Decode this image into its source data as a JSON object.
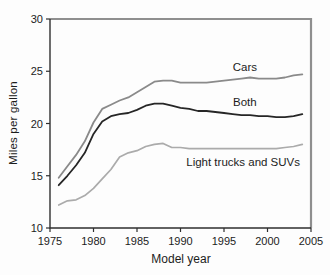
{
  "figure": {
    "background": "#fdfdfd",
    "frame_color_topright": "#8f8f8f",
    "axis_color": "#2f2f2f",
    "text_color": "#1c1c1c"
  },
  "chart_data": {
    "type": "line",
    "title": "",
    "xlabel": "Model year",
    "ylabel": "Miles per gallon",
    "xlim": [
      1975,
      2005
    ],
    "ylim": [
      10,
      30
    ],
    "xticks": [
      1975,
      1980,
      1985,
      1990,
      1995,
      2000,
      2005
    ],
    "yticks": [
      10,
      15,
      20,
      25,
      30
    ],
    "grid": false,
    "legend_position": "inline-annotations",
    "x": [
      1976,
      1977,
      1978,
      1979,
      1980,
      1981,
      1982,
      1983,
      1984,
      1985,
      1986,
      1987,
      1988,
      1989,
      1990,
      1991,
      1992,
      1993,
      1994,
      1995,
      1996,
      1997,
      1998,
      1999,
      2000,
      2001,
      2002,
      2003,
      2004
    ],
    "series": [
      {
        "name": "Cars",
        "color": "#8a8a8a",
        "stroke_width": 1.8,
        "values": [
          14.8,
          15.9,
          17.0,
          18.3,
          20.1,
          21.4,
          21.8,
          22.2,
          22.5,
          23.0,
          23.5,
          24.0,
          24.1,
          24.1,
          23.9,
          23.9,
          23.9,
          23.9,
          24.0,
          24.1,
          24.2,
          24.3,
          24.4,
          24.3,
          24.3,
          24.3,
          24.4,
          24.6,
          24.7
        ],
        "label": {
          "text": "Cars",
          "x": 1997.4,
          "y": 25.4
        }
      },
      {
        "name": "Both",
        "color": "#262626",
        "stroke_width": 1.8,
        "values": [
          14.1,
          15.0,
          16.0,
          17.2,
          19.0,
          20.2,
          20.7,
          20.9,
          21.0,
          21.3,
          21.7,
          21.9,
          21.9,
          21.7,
          21.5,
          21.4,
          21.2,
          21.2,
          21.1,
          21.0,
          20.9,
          20.8,
          20.8,
          20.7,
          20.7,
          20.6,
          20.6,
          20.7,
          20.9
        ],
        "label": {
          "text": "Both",
          "x": 1997.4,
          "y": 22.1
        }
      },
      {
        "name": "Light trucks and SUVs",
        "color": "#ababab",
        "stroke_width": 1.7,
        "values": [
          12.2,
          12.6,
          12.7,
          13.1,
          13.8,
          14.7,
          15.6,
          16.8,
          17.2,
          17.4,
          17.8,
          18.0,
          18.1,
          17.7,
          17.7,
          17.6,
          17.6,
          17.6,
          17.6,
          17.6,
          17.6,
          17.6,
          17.6,
          17.6,
          17.6,
          17.6,
          17.7,
          17.8,
          18.0
        ],
        "label": {
          "text": "Light trucks and SUVs",
          "x": 1997.2,
          "y": 16.3
        }
      }
    ]
  }
}
